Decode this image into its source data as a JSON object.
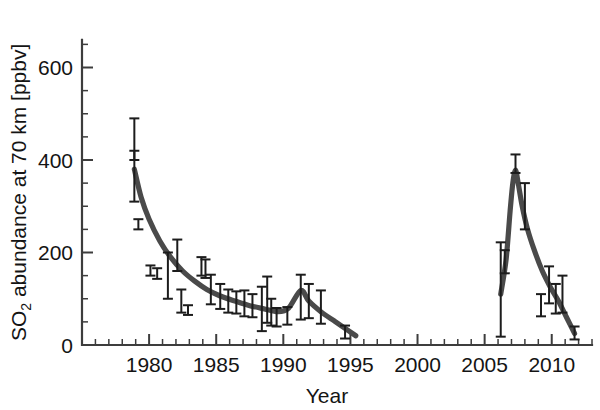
{
  "chart_data": {
    "type": "scatter",
    "title": "",
    "xlabel": "Year",
    "ylabel_main": "SO",
    "ylabel_sub": "2",
    "ylabel_rest": " abundance at 70 km [ppbv]",
    "ylabel_full": "SO2 abundance at 70 km [ppbv]",
    "xlim": [
      1975.0,
      2013.0
    ],
    "ylim": [
      0,
      700
    ],
    "xticks": [
      1980,
      1985,
      1990,
      1995,
      2000,
      2005,
      2010
    ],
    "xticklabels": [
      "1980",
      "1985",
      "1990",
      "1995",
      "2000",
      "2005",
      "2010"
    ],
    "xtick_minor_step": 1,
    "yticks": [
      0,
      200,
      400,
      600
    ],
    "yticklabels": [
      "0",
      "200",
      "400",
      "600"
    ],
    "ytick_minor_step": 50,
    "grid": false,
    "legend": null,
    "marker_color": "#1c1c1c",
    "curve_color": "#4a4a4a",
    "axis_color": "#3d3d3d",
    "series": [
      {
        "name": "SO2 measurements with uncertainty",
        "type": "errorbar",
        "points": [
          {
            "x": 1978.9,
            "y": 450,
            "ylow": 400,
            "yhigh": 490
          },
          {
            "x": 1978.9,
            "y": 380,
            "ylow": 310,
            "yhigh": 420
          },
          {
            "x": 1979.2,
            "y": 260,
            "ylow": 250,
            "yhigh": 272
          },
          {
            "x": 1980.1,
            "y": 160,
            "ylow": 150,
            "yhigh": 172
          },
          {
            "x": 1980.6,
            "y": 155,
            "ylow": 143,
            "yhigh": 166
          },
          {
            "x": 1981.4,
            "y": 150,
            "ylow": 100,
            "yhigh": 200
          },
          {
            "x": 1982.1,
            "y": 195,
            "ylow": 160,
            "yhigh": 228
          },
          {
            "x": 1982.4,
            "y": 95,
            "ylow": 70,
            "yhigh": 120
          },
          {
            "x": 1982.9,
            "y": 75,
            "ylow": 65,
            "yhigh": 86
          },
          {
            "x": 1983.9,
            "y": 170,
            "ylow": 150,
            "yhigh": 190
          },
          {
            "x": 1984.2,
            "y": 165,
            "ylow": 145,
            "yhigh": 185
          },
          {
            "x": 1984.6,
            "y": 120,
            "ylow": 88,
            "yhigh": 152
          },
          {
            "x": 1985.3,
            "y": 105,
            "ylow": 78,
            "yhigh": 132
          },
          {
            "x": 1985.9,
            "y": 95,
            "ylow": 70,
            "yhigh": 120
          },
          {
            "x": 1986.5,
            "y": 92,
            "ylow": 68,
            "yhigh": 116
          },
          {
            "x": 1987.1,
            "y": 90,
            "ylow": 62,
            "yhigh": 118
          },
          {
            "x": 1987.7,
            "y": 85,
            "ylow": 60,
            "yhigh": 110
          },
          {
            "x": 1988.4,
            "y": 78,
            "ylow": 30,
            "yhigh": 126
          },
          {
            "x": 1988.8,
            "y": 110,
            "ylow": 48,
            "yhigh": 148
          },
          {
            "x": 1989.1,
            "y": 72,
            "ylow": 42,
            "yhigh": 100
          },
          {
            "x": 1989.5,
            "y": 60,
            "ylow": 40,
            "yhigh": 80
          },
          {
            "x": 1990.3,
            "y": 62,
            "ylow": 44,
            "yhigh": 82
          },
          {
            "x": 1991.3,
            "y": 100,
            "ylow": 55,
            "yhigh": 152
          },
          {
            "x": 1991.9,
            "y": 95,
            "ylow": 58,
            "yhigh": 132
          },
          {
            "x": 1992.8,
            "y": 72,
            "ylow": 46,
            "yhigh": 118
          },
          {
            "x": 1994.6,
            "y": 28,
            "ylow": 14,
            "yhigh": 42
          },
          {
            "x": 2006.2,
            "y": 120,
            "ylow": 18,
            "yhigh": 222
          },
          {
            "x": 2006.5,
            "y": 180,
            "ylow": 155,
            "yhigh": 205
          },
          {
            "x": 2007.3,
            "y": 395,
            "ylow": 372,
            "yhigh": 412
          },
          {
            "x": 2008.0,
            "y": 290,
            "ylow": 250,
            "yhigh": 350
          },
          {
            "x": 2009.2,
            "y": 85,
            "ylow": 62,
            "yhigh": 110
          },
          {
            "x": 2009.8,
            "y": 130,
            "ylow": 90,
            "yhigh": 170
          },
          {
            "x": 2010.3,
            "y": 100,
            "ylow": 68,
            "yhigh": 132
          },
          {
            "x": 2010.8,
            "y": 110,
            "ylow": 70,
            "yhigh": 150
          },
          {
            "x": 2011.7,
            "y": 25,
            "ylow": 12,
            "yhigh": 40
          }
        ]
      },
      {
        "name": "Model fit 1979-1995",
        "type": "line",
        "x": [
          1978.9,
          1979.4,
          1980.0,
          1980.8,
          1981.6,
          1982.5,
          1983.4,
          1984.3,
          1985.3,
          1986.4,
          1987.5,
          1988.6,
          1989.6,
          1990.4,
          1991.3,
          1991.9,
          1992.8,
          1993.8,
          1994.6,
          1995.4
        ],
        "y": [
          380,
          320,
          272,
          225,
          190,
          160,
          138,
          120,
          106,
          95,
          85,
          78,
          72,
          80,
          118,
          95,
          72,
          52,
          36,
          20
        ]
      },
      {
        "name": "Model fit 2006-2012",
        "type": "line",
        "x": [
          2006.2,
          2006.6,
          2006.9,
          2007.1,
          2007.3,
          2007.5,
          2007.8,
          2008.2,
          2008.7,
          2009.3,
          2009.9,
          2010.5,
          2011.1,
          2011.7
        ],
        "y": [
          110,
          185,
          290,
          350,
          378,
          350,
          300,
          250,
          205,
          160,
          125,
          95,
          60,
          25
        ]
      }
    ]
  }
}
